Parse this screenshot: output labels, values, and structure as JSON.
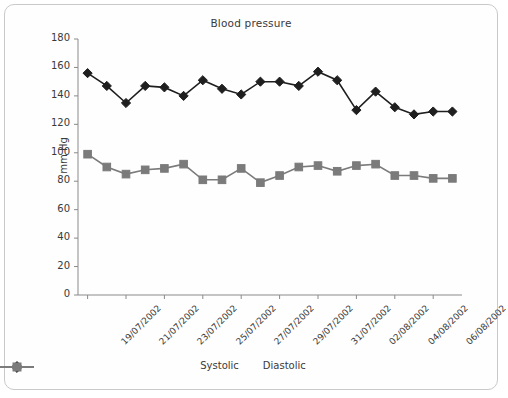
{
  "card": {
    "title": "Blood pressure"
  },
  "axes": {
    "ylabel": "mm Hg",
    "yticks": [
      0,
      20,
      40,
      60,
      80,
      100,
      120,
      140,
      160,
      180
    ],
    "ylim": [
      0,
      180
    ]
  },
  "legend": {
    "items": [
      {
        "label": "Systolic",
        "color": "#1f1f1f",
        "marker": "diamond"
      },
      {
        "label": "Diastolic",
        "color": "#7b7b7b",
        "marker": "square"
      }
    ]
  },
  "chart_data": {
    "type": "line",
    "title": "Blood pressure",
    "xlabel": "",
    "ylabel": "mm Hg",
    "ylim": [
      0,
      180
    ],
    "ytick_step": 20,
    "grid": false,
    "legend_position": "bottom",
    "x": [
      "19/07/2002",
      "20/07/2002",
      "21/07/2002",
      "22/07/2002",
      "23/07/2002",
      "24/07/2002",
      "25/07/2002",
      "26/07/2002",
      "27/07/2002",
      "28/07/2002",
      "29/07/2002",
      "30/07/2002",
      "31/07/2002",
      "01/08/2002",
      "02/08/2002",
      "03/08/2002",
      "04/08/2002",
      "05/08/2002",
      "06/08/2002",
      "07/08/2002"
    ],
    "xtick_labels": [
      "19/07/2002",
      "21/07/2002",
      "23/07/2002",
      "25/07/2002",
      "27/07/2002",
      "29/07/2002",
      "31/07/2002",
      "02/08/2002",
      "04/08/2002",
      "06/08/2002"
    ],
    "xtick_indices": [
      0,
      2,
      4,
      6,
      8,
      10,
      12,
      14,
      16,
      18
    ],
    "series": [
      {
        "name": "Systolic",
        "color": "#1f1f1f",
        "marker": "diamond",
        "values": [
          156,
          147,
          135,
          147,
          146,
          140,
          151,
          145,
          141,
          150,
          150,
          147,
          157,
          151,
          130,
          143,
          132,
          127,
          129,
          129
        ]
      },
      {
        "name": "Diastolic",
        "color": "#7b7b7b",
        "marker": "square",
        "values": [
          99,
          90,
          85,
          88,
          89,
          92,
          81,
          81,
          89,
          79,
          84,
          90,
          91,
          87,
          91,
          92,
          84,
          84,
          82,
          82
        ]
      }
    ]
  },
  "colors": {
    "systolic": "#1f1f1f",
    "diastolic": "#7b7b7b",
    "axis": "#8a8a8a",
    "border": "#c9c9c9",
    "text": "#3a3a3a"
  }
}
